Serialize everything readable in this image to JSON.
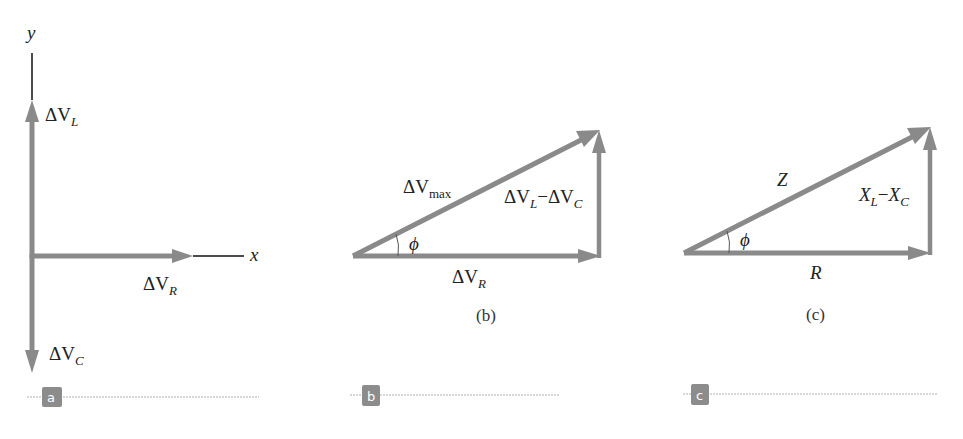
{
  "colors": {
    "vector": "#8a8a8a",
    "axis": "#111111",
    "text": "#222222",
    "badge_bg": "#8c8c8c",
    "divider": "#cccccc"
  },
  "panel_a": {
    "badge": "a",
    "axis_y_label": "y",
    "axis_x_label": "x",
    "vectors": [
      {
        "name": "ΔV_L",
        "base": "ΔV",
        "subscript": "L",
        "direction": "up"
      },
      {
        "name": "ΔV_R",
        "base": "ΔV",
        "subscript": "R",
        "direction": "right"
      },
      {
        "name": "ΔV_C",
        "base": "ΔV",
        "subscript": "C",
        "direction": "down"
      }
    ],
    "labels": {
      "vl_base": "ΔV",
      "vl_sub": "L",
      "vr_base": "ΔV",
      "vr_sub": "R",
      "vc_base": "ΔV",
      "vc_sub": "C"
    }
  },
  "panel_b": {
    "badge": "b",
    "caption": "(b)",
    "labels": {
      "hyp_base": "ΔV",
      "hyp_sub": "max",
      "vert_a_base": "ΔV",
      "vert_a_sub": "L",
      "minus": "−",
      "vert_b_base": "ΔV",
      "vert_b_sub": "C",
      "base_base": "ΔV",
      "base_sub": "R",
      "angle": "ϕ"
    }
  },
  "panel_c": {
    "badge": "c",
    "caption": "(c)",
    "labels": {
      "hyp": "Z",
      "vert_a_base": "X",
      "vert_a_sub": "L",
      "minus": "−",
      "vert_b_base": "X",
      "vert_b_sub": "C",
      "base": "R",
      "angle": "ϕ"
    }
  }
}
